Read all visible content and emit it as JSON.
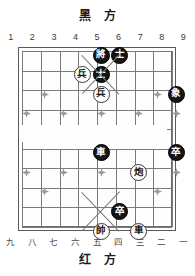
{
  "captions": {
    "black_side": "黑 方",
    "red_side": "红 方"
  },
  "coordinates": {
    "top": [
      "1",
      "2",
      "3",
      "4",
      "5",
      "6",
      "7",
      "8",
      "9"
    ],
    "bottom": [
      "九",
      "八",
      "七",
      "六",
      "五",
      "四",
      "三",
      "二",
      "一"
    ]
  },
  "board": {
    "files": 9,
    "ranks": 10,
    "line_color": "#7a7a7a",
    "border_color": "#5a5a5a",
    "background": "#fefefe",
    "black_piece_color": "#141414",
    "black_text_color": "#ffffff",
    "red_piece_fill": "#ffffff",
    "red_piece_border": "#3a3a3a",
    "red_text_color": "#1d1d1d"
  },
  "chart_data": {
    "type": "table",
    "xlabel": "file",
    "ylabel": "rank",
    "categories": [
      "1",
      "2",
      "3",
      "4",
      "5",
      "6",
      "7",
      "8",
      "9"
    ],
    "pieces": [
      {
        "glyph": "將",
        "side": "black",
        "file": 5,
        "rank": 0,
        "name": "black-general"
      },
      {
        "glyph": "士",
        "side": "black",
        "file": 6,
        "rank": 0,
        "name": "black-advisor-right"
      },
      {
        "glyph": "兵",
        "side": "red",
        "file": 4,
        "rank": 1,
        "name": "red-soldier-upper"
      },
      {
        "glyph": "士",
        "side": "black",
        "file": 5,
        "rank": 1,
        "name": "black-advisor-center"
      },
      {
        "glyph": "兵",
        "side": "red",
        "file": 5,
        "rank": 2,
        "name": "red-soldier-center"
      },
      {
        "glyph": "象",
        "side": "black",
        "file": 9,
        "rank": 2,
        "name": "black-elephant"
      },
      {
        "glyph": "車",
        "side": "black",
        "file": 5,
        "rank": 5,
        "name": "black-chariot"
      },
      {
        "glyph": "卒",
        "side": "black",
        "file": 9,
        "rank": 5,
        "name": "black-soldier-right"
      },
      {
        "glyph": "炮",
        "side": "red",
        "file": 7,
        "rank": 6,
        "name": "red-cannon"
      },
      {
        "glyph": "卒",
        "side": "black",
        "file": 6,
        "rank": 8,
        "name": "black-soldier-low"
      },
      {
        "glyph": "帥",
        "side": "red",
        "file": 5,
        "rank": 9,
        "name": "red-general"
      },
      {
        "glyph": "車",
        "side": "red",
        "file": 7,
        "rank": 9,
        "name": "red-chariot"
      }
    ],
    "markers": [
      {
        "file": 2,
        "rank": 2
      },
      {
        "file": 8,
        "rank": 2
      },
      {
        "file": 1,
        "rank": 3
      },
      {
        "file": 3,
        "rank": 3
      },
      {
        "file": 5,
        "rank": 3
      },
      {
        "file": 7,
        "rank": 3
      },
      {
        "file": 9,
        "rank": 3
      },
      {
        "file": 1,
        "rank": 6
      },
      {
        "file": 3,
        "rank": 6
      },
      {
        "file": 5,
        "rank": 6
      },
      {
        "file": 7,
        "rank": 6
      },
      {
        "file": 9,
        "rank": 6
      },
      {
        "file": 2,
        "rank": 7
      },
      {
        "file": 8,
        "rank": 7
      }
    ]
  }
}
